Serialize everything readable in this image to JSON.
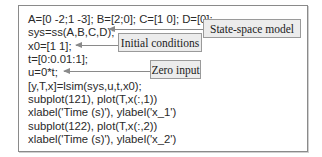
{
  "code": {
    "lines": [
      "A=[0 -2;1 -3]; B=[2;0]; C=[1 0]; D=[0];",
      "sys=ss(A,B,C,D);",
      "x0=[1 1];",
      "t=[0:0.01:1];",
      "u=0*t;",
      "[y,T,x]=lsim(sys,u,t,x0);",
      "subplot(121), plot(T,x(:,1))",
      "xlabel('Time (s)'), ylabel('x_1')",
      "subplot(122), plot(T,x(:,2))",
      "xlabel('Time (s)'), ylabel('x_2')"
    ]
  },
  "annotations": {
    "state_space": "State-space model",
    "initial_conditions": "Initial conditions",
    "zero_input": "Zero input"
  },
  "colors": {
    "border": "#8a8a8a",
    "label_fill": "#ececec",
    "text": "#2a2a2a"
  }
}
